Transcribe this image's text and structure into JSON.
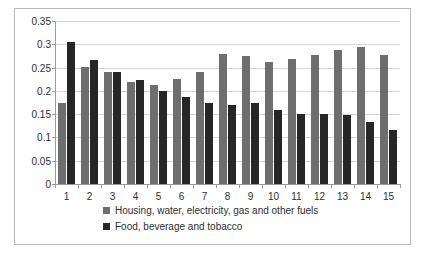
{
  "chart_data": {
    "type": "bar",
    "title": "",
    "subtitle": "",
    "xlabel": "",
    "ylabel": "",
    "categories": [
      "1",
      "2",
      "3",
      "4",
      "5",
      "6",
      "7",
      "8",
      "9",
      "10",
      "11",
      "12",
      "13",
      "14",
      "15"
    ],
    "series": [
      {
        "name": "Housing, water, electricity, gas and other fuels",
        "color": "#6e6e6e",
        "values": [
          0.173,
          0.252,
          0.241,
          0.219,
          0.212,
          0.225,
          0.24,
          0.279,
          0.275,
          0.261,
          0.268,
          0.277,
          0.287,
          0.294,
          0.278
        ]
      },
      {
        "name": "Food, beverage and tobacco",
        "color": "#262626",
        "values": [
          0.305,
          0.266,
          0.24,
          0.224,
          0.2,
          0.187,
          0.173,
          0.17,
          0.174,
          0.158,
          0.15,
          0.15,
          0.148,
          0.133,
          0.115
        ]
      }
    ],
    "ylim": [
      0,
      0.35
    ],
    "ytick_values": [
      0,
      0.05,
      0.1,
      0.15,
      0.2,
      0.25,
      0.3,
      0.35
    ],
    "ytick_labels": [
      "0",
      "0.05",
      "0.1",
      "0.15",
      "0.2",
      "0.25",
      "0.3",
      "0.35"
    ],
    "grid": true,
    "grid_axis": "y",
    "legend_position": "bottom",
    "legend_entries": [
      "Housing, water, electricity, gas and other fuels",
      "Food, beverage and tobacco"
    ]
  }
}
